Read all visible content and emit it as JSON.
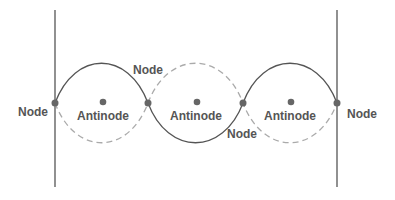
{
  "diagram": {
    "colors": {
      "line": "#555555",
      "dashed": "#aaaaaa",
      "dot": "#666666",
      "text": "#555555"
    },
    "labels": {
      "node_left": "Node",
      "node_top": "Node",
      "node_bottom": "Node",
      "node_right": "Node",
      "antinode_1": "Antinode",
      "antinode_2": "Antinode",
      "antinode_3": "Antinode"
    }
  }
}
